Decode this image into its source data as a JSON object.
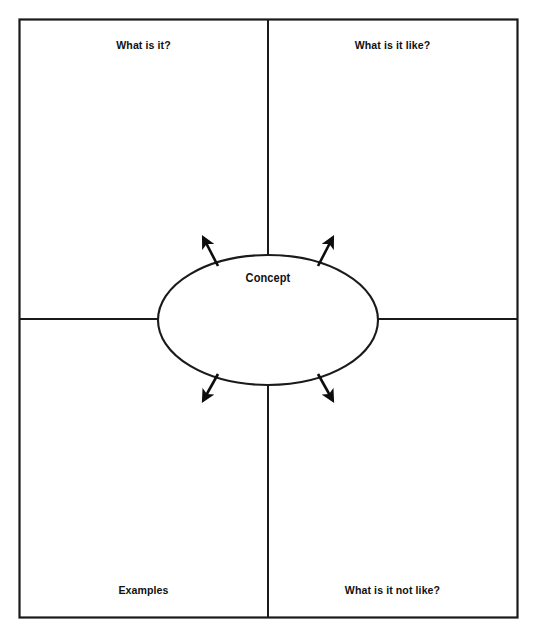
{
  "diagram": {
    "type": "frayer-model",
    "center": {
      "shape": "ellipse",
      "label": "Concept"
    },
    "quadrants": [
      {
        "id": "top-left",
        "label": "What is it?"
      },
      {
        "id": "top-right",
        "label": "What is it like?"
      },
      {
        "id": "bottom-left",
        "label": "Examples"
      },
      {
        "id": "bottom-right",
        "label": "What is it not like?"
      }
    ],
    "arrows": [
      {
        "id": "arrow-top-left",
        "direction": "up-left"
      },
      {
        "id": "arrow-top-right",
        "direction": "up-right"
      },
      {
        "id": "arrow-bottom-left",
        "direction": "down-left"
      },
      {
        "id": "arrow-bottom-right",
        "direction": "down-right"
      }
    ],
    "colors": {
      "stroke": "#1a1a1a",
      "background": "#ffffff",
      "text": "#111111"
    }
  }
}
